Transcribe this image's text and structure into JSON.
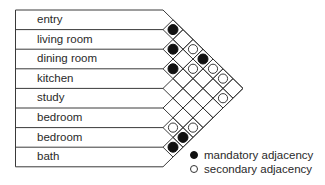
{
  "diagram": {
    "title": "",
    "rooms": [
      "entry",
      "living room",
      "dining room",
      "kitchen",
      "study",
      "bedroom",
      "bedroom",
      "bath"
    ],
    "adjacencies": [
      {
        "a": 0,
        "b": 1,
        "type": "mandatory"
      },
      {
        "a": 1,
        "b": 2,
        "type": "mandatory"
      },
      {
        "a": 2,
        "b": 3,
        "type": "mandatory"
      },
      {
        "a": 0,
        "b": 3,
        "type": "secondary"
      },
      {
        "a": 0,
        "b": 4,
        "type": "mandatory"
      },
      {
        "a": 1,
        "b": 4,
        "type": "secondary"
      },
      {
        "a": 0,
        "b": 5,
        "type": "secondary"
      },
      {
        "a": 0,
        "b": 6,
        "type": "secondary"
      },
      {
        "a": 1,
        "b": 7,
        "type": "secondary"
      },
      {
        "a": 5,
        "b": 6,
        "type": "secondary"
      },
      {
        "a": 4,
        "b": 7,
        "type": "secondary"
      },
      {
        "a": 5,
        "b": 7,
        "type": "mandatory"
      },
      {
        "a": 6,
        "b": 7,
        "type": "mandatory"
      }
    ]
  },
  "legend": {
    "mandatory_label": "mandatory adjacency",
    "secondary_label": "secondary adjacency"
  },
  "colors": {
    "line": "#3a3a3a",
    "mandatory_fill": "#111111",
    "secondary_fill": "#ffffff",
    "text": "#2a2a2a"
  }
}
